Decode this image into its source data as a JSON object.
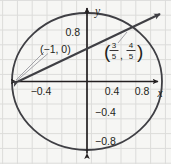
{
  "figure": {
    "kind": "unit-circle-secant-line-diagram",
    "background_color": "#f6f6f4",
    "grid_color": "#dcdcda",
    "ink_color": "#231f20",
    "curve_color": "#3f3f44",
    "leader_color": "#9a9aa0"
  },
  "axes": {
    "x_label": "x",
    "y_label": "y",
    "x_ticks": [
      {
        "label": "−0.4",
        "value": -0.4
      },
      {
        "label": "0.4",
        "value": 0.4
      },
      {
        "label": "0.8",
        "value": 0.8
      }
    ],
    "y_ticks": [
      {
        "label": "0.8",
        "value": 0.8
      },
      {
        "label": "−0.4",
        "value": -0.4
      },
      {
        "label": "−0.8",
        "value": -0.8
      }
    ],
    "x_range": [
      -1.1,
      1.08
    ],
    "y_range": [
      -1.12,
      1.14
    ],
    "grid": true,
    "grid_step": 0.2
  },
  "shapes": {
    "circle": {
      "name": "unit-circle",
      "center": [
        0,
        0
      ],
      "radius": 1
    },
    "line": {
      "name": "secant-line",
      "through": [
        [
          -1,
          0
        ],
        [
          0.6,
          0.8
        ]
      ],
      "slope": 0.5,
      "y_intercept": 0.5
    }
  },
  "points": [
    {
      "name": "point-minus-one-zero",
      "coords": [
        -1,
        0
      ],
      "label_text": "(−1, 0)",
      "label_kind": "plain"
    },
    {
      "name": "point-three-fifths-four-fifths",
      "coords": [
        0.6,
        0.8
      ],
      "label_kind": "fraction-pair",
      "label_open_paren": "(",
      "label_close_paren": ")",
      "x_numerator": "3",
      "x_denominator": "5",
      "separator": ",",
      "y_numerator": "4",
      "y_denominator": "5"
    }
  ]
}
